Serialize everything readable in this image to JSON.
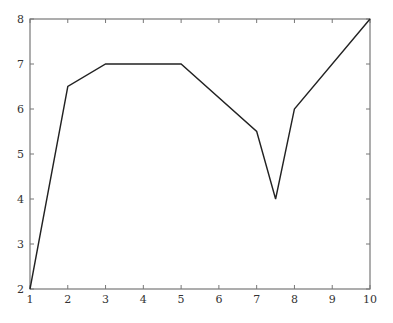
{
  "chart_data": {
    "type": "line",
    "title": "",
    "xlabel": "",
    "ylabel": "",
    "xlim": [
      1,
      10
    ],
    "ylim": [
      2,
      8
    ],
    "grid": false,
    "legend": null,
    "x_ticks": [
      1,
      2,
      3,
      4,
      5,
      6,
      7,
      8,
      9,
      10
    ],
    "y_ticks": [
      2,
      3,
      4,
      5,
      6,
      7,
      8
    ],
    "series": [
      {
        "name": "series-1",
        "color": "#222222",
        "x": [
          1,
          2,
          3,
          5,
          7,
          7.5,
          8,
          10
        ],
        "y": [
          2,
          6.5,
          7,
          7,
          5.5,
          4,
          6,
          8
        ]
      }
    ]
  },
  "layout": {
    "plot_left": 30,
    "plot_right": 370,
    "plot_top": 19,
    "plot_bottom": 289
  }
}
